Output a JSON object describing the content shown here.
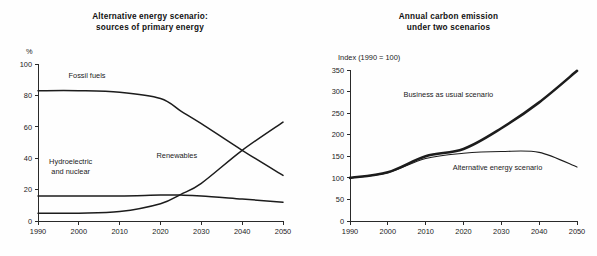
{
  "figure": {
    "background_color": "#fefefe",
    "ink_color": "#1c1c1a"
  },
  "chart_data": [
    {
      "id": "alternative-energy-sources",
      "type": "line",
      "title": "Alternative energy scenario:",
      "subtitle": "sources of primary energy",
      "xlabel": "",
      "ylabel": "%",
      "ylim": [
        0,
        100
      ],
      "xlim": [
        1990,
        2050
      ],
      "yticks": [
        0,
        20,
        40,
        60,
        80,
        100
      ],
      "xticks": [
        1990,
        2000,
        2010,
        2020,
        2030,
        2040,
        2050
      ],
      "grid": false,
      "legend_position": "inline-annotations",
      "x": [
        1990,
        2000,
        2010,
        2020,
        2025,
        2030,
        2040,
        2050
      ],
      "series": [
        {
          "name": "Fossil fuels",
          "label": "Fossil fuels",
          "stroke_width": 1.5,
          "values": [
            83,
            83,
            82,
            78,
            70,
            62,
            45,
            29
          ],
          "label_x": 2002,
          "label_y": 91
        },
        {
          "name": "Hydroelectric and nuclear",
          "label_line1": "Hydroelectric",
          "label_line2": "and nuclear",
          "stroke_width": 1.5,
          "values": [
            16,
            16,
            16,
            16.5,
            16.5,
            16,
            14,
            12
          ],
          "label_x": 1998,
          "label_y": 36
        },
        {
          "name": "Renewables",
          "label": "Renewables",
          "stroke_width": 1.5,
          "values": [
            5,
            5,
            6,
            11,
            17,
            24,
            45,
            63
          ],
          "label_x": 2024,
          "label_y": 40
        }
      ]
    },
    {
      "id": "annual-carbon-emission",
      "type": "line",
      "title": "Annual carbon emission",
      "subtitle": "under two scenarios",
      "xlabel": "",
      "ylabel": "Index (1990 = 100)",
      "ylim": [
        0,
        350
      ],
      "xlim": [
        1990,
        2050
      ],
      "yticks": [
        0,
        50,
        100,
        150,
        200,
        250,
        300,
        350
      ],
      "xticks": [
        1990,
        2000,
        2010,
        2020,
        2030,
        2040,
        2050
      ],
      "grid": false,
      "legend_position": "inline-annotations",
      "x": [
        1990,
        2000,
        2010,
        2020,
        2030,
        2040,
        2050
      ],
      "series": [
        {
          "name": "Business as usual scenario",
          "label": "Business as usual scenario",
          "stroke_width": 2.6,
          "values": [
            100,
            113,
            150,
            167,
            215,
            275,
            348
          ],
          "label_x": 2016,
          "label_y": 288
        },
        {
          "name": "Alternative energy scenario",
          "label": "Alternative energy scenario",
          "stroke_width": 1.1,
          "values": [
            100,
            112,
            145,
            157,
            161,
            159,
            125
          ],
          "label_x": 2029,
          "label_y": 119
        }
      ]
    }
  ]
}
